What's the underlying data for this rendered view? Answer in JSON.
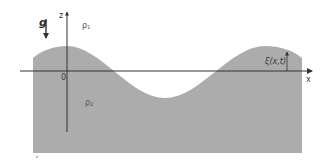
{
  "figure": {
    "type": "two-fluid interface wave diagram",
    "labels": {
      "gravity": "g",
      "z_axis": "z",
      "x_axis": "x",
      "origin": "0",
      "upper_density": "ρ",
      "upper_density_sub": "1",
      "lower_density": "ρ",
      "lower_density_sub": "2",
      "displacement": "ξ(x,t)"
    },
    "colors": {
      "fluid_fill": "#acacac",
      "axis_line": "#333333",
      "background": "#ffffff"
    }
  }
}
